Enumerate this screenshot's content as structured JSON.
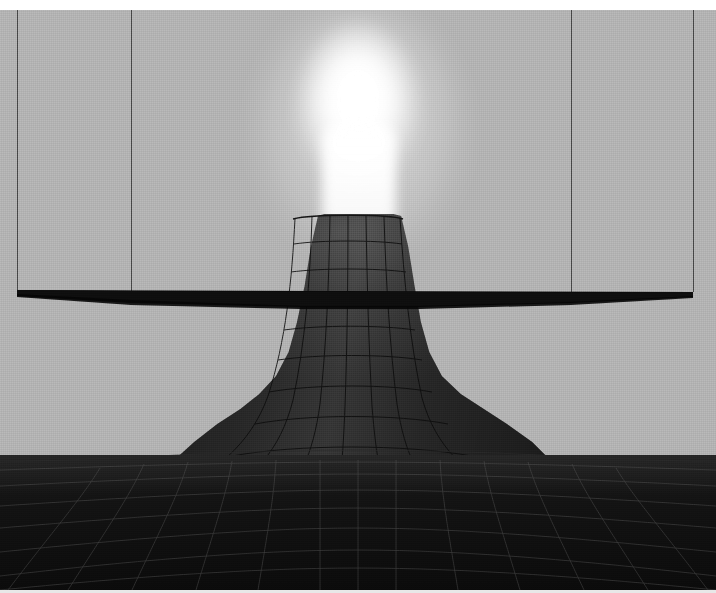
{
  "scene": {
    "title": "3D Volcano Plume Visualization",
    "type": "3d-surface-render",
    "width": 716,
    "height": 593,
    "background_color": "#b3b3b3",
    "top_border_color": "#ffffff",
    "bottom_border_color": "#e8e8e8"
  },
  "bounding_box": {
    "name": "wireframe-bounding-box",
    "line_color": "#4a4a4a",
    "line_width_px": 1,
    "vertical_edges": [
      {
        "label": "left-outer-edge",
        "x": 17,
        "y_top": 10,
        "y_bottom": 292
      },
      {
        "label": "left-inner-edge",
        "x": 131,
        "y_top": 10,
        "y_bottom": 298
      },
      {
        "label": "right-inner-edge",
        "x": 571,
        "y_top": 10,
        "y_bottom": 298
      },
      {
        "label": "right-outer-edge",
        "x": 693,
        "y_top": 10,
        "y_bottom": 292
      }
    ]
  },
  "cutting_plane": {
    "name": "horizontal-slice-plane",
    "color": "#0d0d0d",
    "edge_color": "#000000",
    "orientation": "near-edge-on",
    "left_y": 290,
    "right_y": 293,
    "front_y": 306,
    "thickness_px": 15
  },
  "volcano": {
    "name": "volcano-cone-mesh",
    "surface_color": "#3a3a3a",
    "wire_color": "#0a0a0a",
    "crater_rim_y": 216,
    "crater_left_x": 292,
    "crater_right_x": 400,
    "base_left_x": 150,
    "base_right_x": 570,
    "base_y": 500,
    "grid_columns": 7,
    "grid_rows": 9
  },
  "plume": {
    "name": "emissive-plume",
    "color": "#ffffff",
    "glow_color": "rgba(255,255,255,0.55)",
    "apex_y": 22,
    "center_x": 358,
    "max_width_px": 132,
    "description": "bright white eruption column rising from crater"
  },
  "terrain": {
    "name": "basal-terrain-mesh",
    "surface_color": "#121212",
    "wire_color": "#6b6b6b",
    "horizon_y": 455,
    "grid_columns": 14,
    "grid_rows": 7
  }
}
